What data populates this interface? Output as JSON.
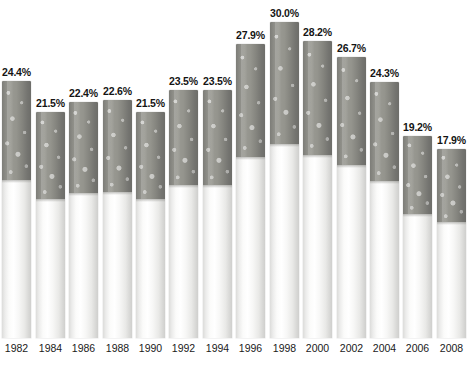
{
  "chart": {
    "title": "",
    "subtitle": "",
    "xlabel": "",
    "ylabel": "",
    "value_suffix": "%"
  },
  "chart_data": {
    "type": "bar",
    "title": "",
    "xlabel": "",
    "ylabel": "",
    "grid": false,
    "legend": "none",
    "ylim": [
      0,
      30.0
    ],
    "categories": [
      "1982",
      "1984",
      "1986",
      "1988",
      "1990",
      "1992",
      "1994",
      "1996",
      "1998",
      "2000",
      "2002",
      "2004",
      "2006",
      "2008"
    ],
    "values": [
      24.4,
      21.5,
      22.4,
      22.6,
      21.5,
      23.5,
      23.5,
      27.9,
      30.0,
      28.2,
      26.7,
      24.3,
      19.2,
      17.9
    ],
    "value_labels": [
      "24.4%",
      "21.5%",
      "22.4%",
      "22.6%",
      "21.5%",
      "23.5%",
      "23.5%",
      "27.9%",
      "30.0%",
      "28.2%",
      "26.7%",
      "24.3%",
      "19.2%",
      "17.9%"
    ],
    "tick_labels": [
      "1982",
      "1984",
      "1986",
      "1988",
      "1990",
      "1992",
      "1994",
      "1996",
      "1998",
      "2000",
      "2002",
      "2004",
      "2006",
      "2008"
    ]
  },
  "colors": {
    "filter": "#8e8e88",
    "paper": "#fbfbfa",
    "label_text": "#141414",
    "axis_text": "#1a1a1a",
    "background": "#ffffff"
  },
  "bars": [
    {
      "label": "24.4%",
      "year": "1982",
      "value": 24.4
    },
    {
      "label": "21.5%",
      "year": "1984",
      "value": 21.5
    },
    {
      "label": "22.4%",
      "year": "1986",
      "value": 22.4
    },
    {
      "label": "22.6%",
      "year": "1988",
      "value": 22.6
    },
    {
      "label": "21.5%",
      "year": "1990",
      "value": 21.5
    },
    {
      "label": "23.5%",
      "year": "1992",
      "value": 23.5
    },
    {
      "label": "23.5%",
      "year": "1994",
      "value": 23.5
    },
    {
      "label": "27.9%",
      "year": "1996",
      "value": 27.9
    },
    {
      "label": "30.0%",
      "year": "1998",
      "value": 30.0
    },
    {
      "label": "28.2%",
      "year": "2000",
      "value": 28.2
    },
    {
      "label": "26.7%",
      "year": "2002",
      "value": 26.7
    },
    {
      "label": "24.3%",
      "year": "2004",
      "value": 24.3
    },
    {
      "label": "19.2%",
      "year": "2006",
      "value": 19.2
    },
    {
      "label": "17.9%",
      "year": "2008",
      "value": 17.9
    }
  ]
}
